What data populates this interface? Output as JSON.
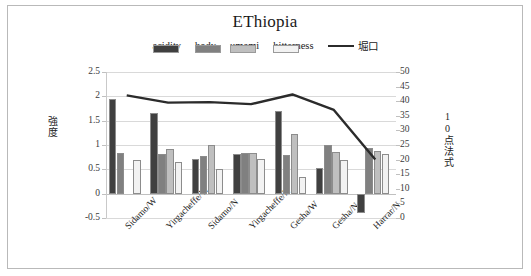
{
  "chart_data": {
    "type": "bar",
    "title": "EThiopia",
    "xlabel": "",
    "ylabel": "強度",
    "y2label": "10点法式",
    "ylim": [
      -0.5,
      2.5
    ],
    "y2lim": [
      0,
      50
    ],
    "yticks": [
      "2.5",
      "2",
      "1.5",
      "1",
      "0.5",
      "0",
      "-0.5"
    ],
    "y2ticks": [
      "50",
      "45",
      "40",
      "35",
      "30",
      "25",
      "20",
      "15",
      "10",
      "5",
      "0"
    ],
    "grid": true,
    "legend_position": "top",
    "categories": [
      "Sidamo/W",
      "Yirgacheffe/W",
      "Sidamo/N",
      "Yirgacheffe/N",
      "Gesha/W",
      "Gesha/N",
      "Harrar/N"
    ],
    "series": [
      {
        "name": "acidity",
        "type": "bar",
        "axis": "left",
        "color": "#404040",
        "values": [
          1.95,
          1.66,
          0.72,
          0.82,
          1.7,
          0.53,
          -0.4
        ]
      },
      {
        "name": "body",
        "type": "bar",
        "axis": "left",
        "color": "#808080",
        "values": [
          0.84,
          0.81,
          0.78,
          0.83,
          0.79,
          1.0,
          0.93
        ]
      },
      {
        "name": "umami",
        "type": "bar",
        "axis": "left",
        "color": "#bfbfbf",
        "values": [
          0.0,
          0.91,
          1.01,
          0.84,
          1.23,
          0.86,
          0.87
        ]
      },
      {
        "name": "bitterness",
        "type": "bar",
        "axis": "left",
        "color": "#f2f2f2",
        "values": [
          0.69,
          0.65,
          0.5,
          0.72,
          0.34,
          0.69,
          0.81
        ]
      },
      {
        "name": "堀口",
        "type": "line",
        "axis": "right",
        "color": "#2b2b2b",
        "values": [
          42.0,
          39.5,
          39.7,
          39.0,
          42.3,
          37.0,
          20.0
        ]
      }
    ]
  },
  "legend": {
    "items": [
      {
        "label": "acidity",
        "icon": "bar-swatch"
      },
      {
        "label": "body",
        "icon": "bar-swatch"
      },
      {
        "label": "umami",
        "icon": "bar-swatch"
      },
      {
        "label": "bitterness",
        "icon": "bar-swatch"
      },
      {
        "label": "堀口",
        "icon": "line-swatch"
      }
    ]
  }
}
